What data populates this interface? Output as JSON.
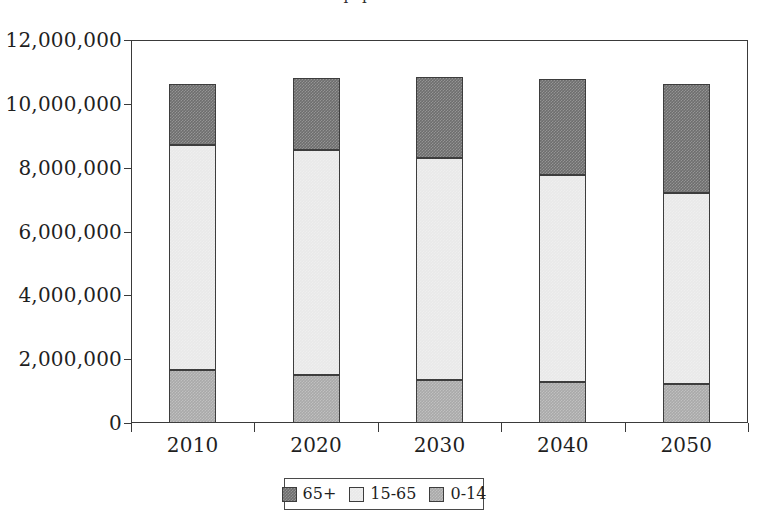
{
  "title_fragment": "population",
  "chart_data": {
    "type": "bar",
    "subtype": "stacked-vertical",
    "title": "",
    "xlabel": "",
    "ylabel": "",
    "categories": [
      "2010",
      "2020",
      "2030",
      "2040",
      "2050"
    ],
    "series": [
      {
        "name": "0-14",
        "values": [
          1660000,
          1500000,
          1350000,
          1280000,
          1220000
        ],
        "color": "#a9a9a9",
        "stack_order": 1
      },
      {
        "name": "15-65",
        "values": [
          7050000,
          7050000,
          6950000,
          6500000,
          6000000
        ],
        "color": "#e9e9e9",
        "stack_order": 2
      },
      {
        "name": "65+",
        "values": [
          1900000,
          2250000,
          2550000,
          3000000,
          3400000
        ],
        "color": "#6e6e6e",
        "stack_order": 3
      }
    ],
    "totals": [
      10610000,
      10800000,
      10850000,
      10780000,
      10620000
    ],
    "ylim": [
      0,
      12000000
    ],
    "ytick_values": [
      0,
      2000000,
      4000000,
      6000000,
      8000000,
      10000000,
      12000000
    ],
    "ytick_labels": [
      "0",
      "2,000,000",
      "4,000,000",
      "6,000,000",
      "8,000,000",
      "10,000,000",
      "12,000,000"
    ],
    "grid": true,
    "grid_axis": "y",
    "legend": {
      "position": "bottom-center",
      "entries": [
        {
          "label": "65+",
          "color": "#6e6e6e"
        },
        {
          "label": "15-65",
          "color": "#e9e9e9"
        },
        {
          "label": "0-14",
          "color": "#a9a9a9"
        }
      ]
    }
  }
}
